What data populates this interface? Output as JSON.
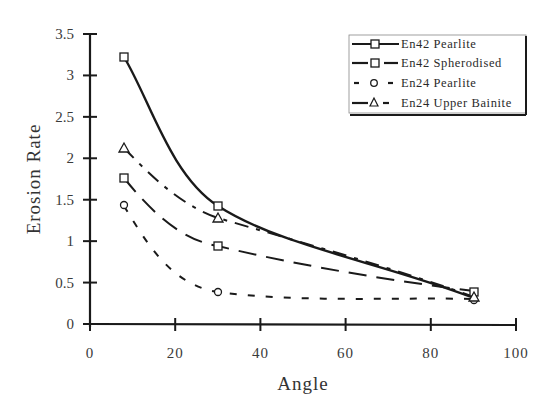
{
  "chart_data": {
    "type": "line",
    "title": "",
    "xlabel": "Angle",
    "ylabel": "Erosion Rate",
    "xlim": [
      0,
      100
    ],
    "ylim": [
      0,
      3.5
    ],
    "xticks": [
      0,
      20,
      40,
      60,
      80,
      100
    ],
    "yticks": [
      0,
      0.5,
      1,
      1.5,
      2,
      2.5,
      3,
      3.5
    ],
    "xtick_labels": [
      "0",
      "20",
      "40",
      "60",
      "80",
      "100"
    ],
    "ytick_labels": [
      "0",
      "0.5",
      "1",
      "1.5",
      "2",
      "2.5",
      "3",
      "3.5"
    ],
    "grid": false,
    "legend_position": "upper right",
    "x": [
      8,
      30,
      90
    ],
    "series": [
      {
        "name": "En42 Pearlite",
        "marker": "square",
        "line": "solid",
        "values": [
          3.22,
          1.42,
          0.35
        ]
      },
      {
        "name": "En42 Spherodised",
        "marker": "square",
        "line": "long-dash",
        "values": [
          1.75,
          0.94,
          0.4
        ]
      },
      {
        "name": "En24 Pearlite",
        "marker": "circle",
        "line": "short-dash",
        "values": [
          1.43,
          0.39,
          0.3
        ]
      },
      {
        "name": "En24 Upper Bainite",
        "marker": "triangle",
        "line": "dash-dot",
        "values": [
          2.12,
          1.28,
          0.32
        ]
      }
    ],
    "colors": {
      "line": "#1a1a1a",
      "background": "#ffffff"
    }
  }
}
